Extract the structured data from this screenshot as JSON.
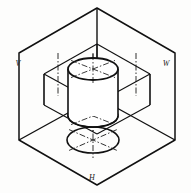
{
  "figure": {
    "drawing_type": "isometric-line-drawing",
    "background_color": "#fdfdfc",
    "line_color": "#111111",
    "thin_line_color": "#1a1a1a",
    "center_line_color": "#1a1a1a",
    "canvas": {
      "width": 191,
      "height": 193
    }
  },
  "labels": {
    "vertical_plane": "V",
    "profile_plane": "W",
    "horizontal_plane": "H"
  },
  "label_positions": {
    "vertical_plane": {
      "x": 18,
      "y": 66
    },
    "profile_plane": {
      "x": 166,
      "y": 66
    },
    "horizontal_plane": {
      "x": 92,
      "y": 180
    }
  },
  "outer_hexagon": {
    "name": "trihedral-corner-outline",
    "points": "97,8 175,53 175,140 97,185 19,140 19,53"
  },
  "corner_axes": {
    "name": "corner-edges",
    "vertical_edge": {
      "x1": 97,
      "y1": 8,
      "x2": 97,
      "y2": 97
    },
    "left_edge": {
      "x1": 97,
      "y1": 97,
      "x2": 19,
      "y2": 140
    },
    "right_edge": {
      "x1": 97,
      "y1": 97,
      "x2": 175,
      "y2": 140
    }
  },
  "inner_box": {
    "name": "inner-prism-wireframe",
    "top_front": "97,44 44,74",
    "top_right": "97,44 150,74",
    "front_left_vertical": {
      "x1": 44,
      "y1": 74,
      "x2": 44,
      "y2": 105
    },
    "right_vertical": {
      "x1": 150,
      "y1": 74,
      "x2": 150,
      "y2": 105
    },
    "center_vertical": {
      "x1": 97,
      "y1": 44,
      "x2": 97,
      "y2": 97
    },
    "bottom_left": "44,105 97,134",
    "bottom_right": "150,105 97,134",
    "mid_left": "44,74 97,103",
    "mid_right": "150,74 97,103"
  },
  "cylinder": {
    "name": "cylinder-solid",
    "top_ellipse": {
      "cx": 93,
      "cy": 69,
      "rx": 25,
      "ry": 11
    },
    "bottom_ellipse": {
      "cx": 93,
      "cy": 116,
      "rx": 25,
      "ry": 11
    },
    "left_side": {
      "x1": 68,
      "y1": 69,
      "x2": 68,
      "y2": 116
    },
    "right_side": {
      "x1": 118,
      "y1": 69,
      "x2": 118,
      "y2": 116
    },
    "height": 47,
    "axis_line": {
      "x1": 93,
      "y1": 53,
      "x2": 93,
      "y2": 132
    }
  },
  "horizontal_projection": {
    "name": "projected-ellipse-on-h-plane",
    "ellipse": {
      "cx": 93,
      "cy": 140,
      "rx": 26,
      "ry": 13
    },
    "cross_marks": true
  },
  "center_lines": {
    "left_plane_vertical": {
      "x1": 58,
      "y1": 53,
      "x2": 58,
      "y2": 96
    },
    "right_plane_vertical": {
      "x1": 136,
      "y1": 53,
      "x2": 136,
      "y2": 96
    },
    "cylinder_axis": {
      "x1": 93,
      "y1": 53,
      "x2": 93,
      "y2": 133
    },
    "dash_pattern": "6 2 1.5 2"
  },
  "annotations": {
    "top_face_cross": true,
    "bottom_face_cross": true,
    "projection_cross": true
  }
}
